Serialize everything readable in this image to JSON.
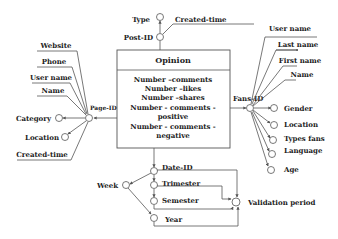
{
  "diagram": {
    "type": "multidimensional-fact-diagram",
    "fact": {
      "name": "Opinion",
      "measures": [
        "Number –comments",
        "Number –likes",
        "Number –shares",
        "Number - comments -",
        "positive",
        "Number - comments -",
        "negative"
      ]
    },
    "dimensions": {
      "post": {
        "key": "Post-ID",
        "attributes": [
          "Type",
          "Created-time"
        ]
      },
      "page": {
        "key": "Page-ID",
        "descriptive": [
          "Website",
          "Phone",
          "User name",
          "Name",
          "Created-time"
        ],
        "attributes": [
          "Category",
          "Location"
        ]
      },
      "fans": {
        "key": "Fans-ID",
        "descriptive": [
          "User name",
          "Last name",
          "First name",
          "Name"
        ],
        "attributes": [
          "Gender",
          "Location",
          "Types fans",
          "Language",
          "Age"
        ]
      },
      "date": {
        "key": "Date-ID",
        "hierarchy": [
          "Trimester",
          "Semester",
          "Year"
        ],
        "other": [
          "Week",
          "Validation period"
        ]
      }
    },
    "colors": {
      "line": "#555555",
      "text": "#222222",
      "background": "#ffffff"
    }
  }
}
